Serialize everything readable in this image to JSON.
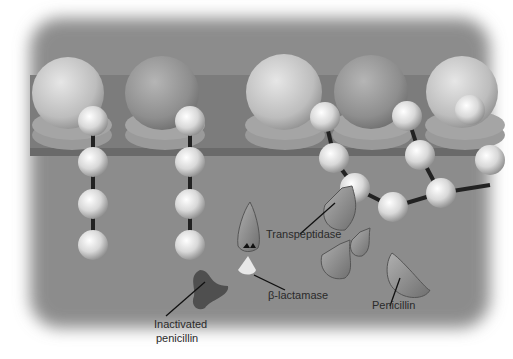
{
  "figure": {
    "colors": {
      "background_panel": "#8c8c8c",
      "membrane_band": "#7a7a7a",
      "sphere_light": "#f2f2f2",
      "sphere_dark": "#9a9a9a",
      "enzyme_fill": "#8e8e8e",
      "inactivated_fill": "#505050",
      "label_text": "#2a2a2a"
    }
  },
  "labels": {
    "transpeptidase": "Transpeptidase",
    "beta_lactamase": "β-lactamase",
    "penicillin": "Penicillin",
    "inactivated_line1": "Inactivated",
    "inactivated_line2": "penicillin"
  }
}
